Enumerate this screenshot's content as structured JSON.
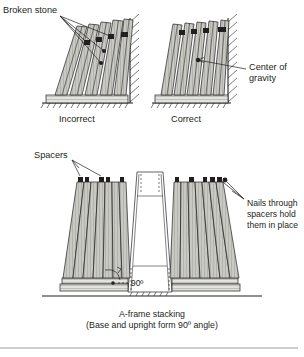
{
  "figure": {
    "title_caption": "A-frame stacking",
    "subtitle_caption": "(Base and upright form 90º angle)",
    "panels": {
      "incorrect": {
        "label": "Incorrect",
        "callout": "Broken stone"
      },
      "correct": {
        "label": "Correct",
        "callout_line1": "Center of",
        "callout_line2": "gravity"
      },
      "aframe": {
        "callout_spacers": "Spacers",
        "callout_nails_line1": "Nails through",
        "callout_nails_line2": "spacers hold",
        "callout_nails_line3": "them in place",
        "angle_label": "90º"
      }
    },
    "colors": {
      "ink": "#231f20",
      "slab_fill": "#c9c9c4",
      "slab_fill_light": "#d8d8d3",
      "base_fill": "#e2e2de",
      "background": "#ffffff",
      "divider": "#9a9a9a"
    }
  }
}
